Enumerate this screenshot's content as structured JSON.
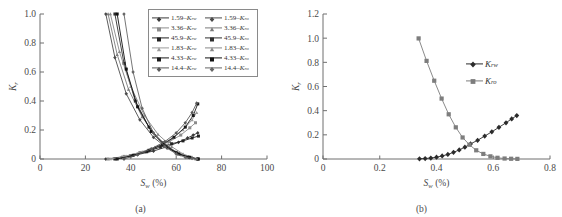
{
  "figure": {
    "panels": [
      {
        "caption": "(a)",
        "xlabel_main": "S",
        "xlabel_sub": "w",
        "xlabel_unit": " (%)",
        "ylabel_main": "K",
        "ylabel_sub": "r"
      },
      {
        "caption": "(b)",
        "xlabel_main": "S",
        "xlabel_sub": "w",
        "xlabel_unit": " (%)",
        "ylabel_main": "K",
        "ylabel_sub": "r"
      }
    ]
  },
  "chart_data": [
    {
      "type": "line",
      "panel": "(a)",
      "title": "",
      "xlabel": "Sw (%)",
      "ylabel": "Kr",
      "xlim": [
        0,
        100
      ],
      "ylim": [
        0,
        1.0
      ],
      "xticks": [
        0,
        20,
        40,
        60,
        80,
        100
      ],
      "yticks": [
        0,
        0.2,
        0.4,
        0.6,
        0.8,
        1.0
      ],
      "xticklabels": [
        "0",
        "20",
        "40",
        "60",
        "80",
        "100"
      ],
      "yticklabels": [
        "0",
        "0.2",
        "0.4",
        "0.6",
        "0.8",
        "1.0"
      ],
      "grid": false,
      "legend_position": "upper-right",
      "legend_columns": 2,
      "legend": [
        "1.59-Krw",
        "1.59-Kro",
        "3.36-Krw",
        "3.36-Kro",
        "45.9-Krw",
        "45.9-Kro",
        "1.83-Krw",
        "1.83-Kro",
        "4.33-Krw",
        "4.33-Kro",
        "14.4-Krw",
        "14.4-Kro"
      ],
      "series": [
        {
          "name": "1.59-Krw",
          "color": "#3a3a3a",
          "marker": "diamond",
          "x": [
            29.0,
            36.0,
            43.0,
            50.0,
            56.0,
            61.0,
            65.0,
            67.5,
            69.5
          ],
          "y": [
            0.0,
            0.012,
            0.03,
            0.055,
            0.085,
            0.115,
            0.145,
            0.165,
            0.18
          ]
        },
        {
          "name": "1.59-Kro",
          "color": "#4a4a4a",
          "marker": "diamond",
          "x": [
            29.0,
            33.0,
            38.0,
            44.0,
            50.0,
            56.0,
            62.0,
            66.0,
            69.5
          ],
          "y": [
            1.0,
            0.7,
            0.45,
            0.27,
            0.15,
            0.075,
            0.03,
            0.01,
            0.0
          ]
        },
        {
          "name": "3.36-Krw",
          "color": "#8c8c8c",
          "marker": "square",
          "x": [
            30.0,
            37.0,
            44.0,
            51.0,
            57.0,
            62.0,
            66.0,
            68.5
          ],
          "y": [
            0.0,
            0.018,
            0.045,
            0.08,
            0.12,
            0.165,
            0.215,
            0.25
          ]
        },
        {
          "name": "3.36-Kro",
          "color": "#7a7a7a",
          "marker": "triangle",
          "x": [
            30.0,
            34.0,
            39.0,
            45.0,
            51.0,
            57.0,
            62.0,
            66.0,
            68.5
          ],
          "y": [
            1.0,
            0.72,
            0.48,
            0.29,
            0.16,
            0.08,
            0.032,
            0.012,
            0.0
          ]
        },
        {
          "name": "45.9-Krw",
          "color": "#222222",
          "marker": "square",
          "x": [
            33.0,
            40.0,
            47.0,
            53.0,
            58.0,
            63.0,
            67.0,
            69.8
          ],
          "y": [
            0.0,
            0.022,
            0.05,
            0.082,
            0.105,
            0.125,
            0.145,
            0.158
          ]
        },
        {
          "name": "45.9-Kro",
          "color": "#2e2e2e",
          "marker": "square",
          "x": [
            33.0,
            37.0,
            42.0,
            48.0,
            54.0,
            60.0,
            65.0,
            69.8
          ],
          "y": [
            1.0,
            0.66,
            0.4,
            0.22,
            0.11,
            0.045,
            0.014,
            0.0
          ]
        },
        {
          "name": "1.83-Krw",
          "color": "#9a9a9a",
          "marker": "triangle",
          "x": [
            31.0,
            38.0,
            45.0,
            52.0,
            58.0,
            63.0,
            67.0,
            69.0
          ],
          "y": [
            0.0,
            0.02,
            0.05,
            0.09,
            0.14,
            0.2,
            0.27,
            0.32
          ]
        },
        {
          "name": "1.83-Kro",
          "color": "#888888",
          "marker": "triangle",
          "x": [
            31.0,
            35.0,
            40.0,
            46.0,
            52.0,
            58.0,
            63.0,
            67.0,
            69.0
          ],
          "y": [
            1.0,
            0.74,
            0.5,
            0.3,
            0.17,
            0.085,
            0.035,
            0.012,
            0.0
          ]
        },
        {
          "name": "4.33-Krw",
          "color": "#1a1a1a",
          "marker": "square",
          "x": [
            34.0,
            41.0,
            48.0,
            54.0,
            59.0,
            64.0,
            67.5,
            69.5
          ],
          "y": [
            0.0,
            0.025,
            0.06,
            0.1,
            0.15,
            0.22,
            0.3,
            0.38
          ]
        },
        {
          "name": "4.33-Kro",
          "color": "#111111",
          "marker": "square",
          "x": [
            34.0,
            38.0,
            43.0,
            49.0,
            55.0,
            61.0,
            66.0,
            69.5
          ],
          "y": [
            1.0,
            0.62,
            0.36,
            0.19,
            0.09,
            0.035,
            0.012,
            0.0
          ]
        },
        {
          "name": "14.4-Krw",
          "color": "#5a5a5a",
          "marker": "diamond",
          "x": [
            37.0,
            43.0,
            49.0,
            55.0,
            60.0,
            64.0,
            67.0,
            69.0
          ],
          "y": [
            0.0,
            0.03,
            0.07,
            0.12,
            0.18,
            0.25,
            0.32,
            0.385
          ]
        },
        {
          "name": "14.4-Kro",
          "color": "#666666",
          "marker": "diamond",
          "x": [
            37.0,
            41.0,
            45.0,
            50.0,
            55.0,
            60.0,
            64.0,
            67.0,
            69.0
          ],
          "y": [
            1.0,
            0.6,
            0.35,
            0.18,
            0.085,
            0.035,
            0.012,
            0.004,
            0.0
          ]
        }
      ]
    },
    {
      "type": "line",
      "panel": "(b)",
      "title": "",
      "xlabel": "Sw (%)",
      "ylabel": "Kr",
      "xlim": [
        0,
        0.8
      ],
      "ylim": [
        0,
        1.2
      ],
      "xticks": [
        0,
        0.2,
        0.4,
        0.6,
        0.8
      ],
      "yticks": [
        0,
        0.2,
        0.4,
        0.6,
        0.8,
        1.0,
        1.2
      ],
      "xticklabels": [
        "0",
        "0.2",
        "0.4",
        "0.6",
        "0.8"
      ],
      "yticklabels": [
        "0",
        "0.2",
        "0.4",
        "0.6",
        "0.8",
        "1.0",
        "1.2"
      ],
      "grid": false,
      "legend_position": "right-middle",
      "legend": [
        "Krw",
        "Kro"
      ],
      "series": [
        {
          "name": "Krw",
          "color": "#2b2b2b",
          "marker": "diamond",
          "x": [
            0.34,
            0.36,
            0.38,
            0.4,
            0.42,
            0.44,
            0.46,
            0.48,
            0.5,
            0.52,
            0.545,
            0.57,
            0.595,
            0.62,
            0.645,
            0.665,
            0.683
          ],
          "y": [
            0.002,
            0.004,
            0.008,
            0.015,
            0.025,
            0.038,
            0.055,
            0.075,
            0.098,
            0.125,
            0.155,
            0.19,
            0.225,
            0.262,
            0.3,
            0.332,
            0.36
          ]
        },
        {
          "name": "Kro",
          "color": "#7d7d7d",
          "marker": "square",
          "x": [
            0.337,
            0.365,
            0.392,
            0.418,
            0.443,
            0.468,
            0.492,
            0.516,
            0.54,
            0.565,
            0.59,
            0.615,
            0.64,
            0.663,
            0.685
          ],
          "y": [
            0.998,
            0.812,
            0.648,
            0.5,
            0.37,
            0.262,
            0.178,
            0.118,
            0.072,
            0.042,
            0.022,
            0.01,
            0.004,
            0.002,
            0.001
          ]
        }
      ]
    }
  ]
}
